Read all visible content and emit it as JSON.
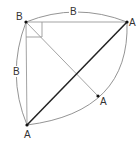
{
  "diagram": {
    "points": {
      "B": {
        "label": "B",
        "x": 26,
        "y": 22
      },
      "A_top_right": {
        "label": "A",
        "x": 127,
        "y": 22
      },
      "A_bottom_left": {
        "label": "A",
        "x": 27,
        "y": 125
      },
      "A_mid": {
        "label": "A",
        "x": 98,
        "y": 96
      }
    },
    "edge_labels": {
      "top": "B",
      "left": "B"
    },
    "colors": {
      "thick_line": "#222222",
      "thin_line": "#999999",
      "arc": "#888888",
      "point": "#111111"
    }
  }
}
